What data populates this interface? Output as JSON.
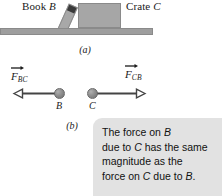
{
  "figure": {
    "panel_a": {
      "caption": "(a)",
      "book_label_text": "Book ",
      "book_label_symbol": "B",
      "crate_label_text": "Crate ",
      "crate_label_symbol": "C",
      "book_shape_name": "tilted book leaning on crate",
      "crate_shape_name": "crate block",
      "ground_name": "ground surface"
    },
    "panel_b": {
      "caption": "(b)",
      "vector_left": {
        "symbol": "F",
        "subscript": "BC",
        "direction": "left",
        "point_label": "B"
      },
      "vector_right": {
        "symbol": "F",
        "subscript": "CB",
        "direction": "right",
        "point_label": "C"
      }
    },
    "callout": {
      "lines": [
        {
          "pre": "The force on ",
          "em": "B",
          "post": ""
        },
        {
          "pre": "due to ",
          "em": "C",
          "post": " has the same"
        },
        {
          "pre": "magnitude as the",
          "em": "",
          "post": ""
        },
        {
          "pre": "force on ",
          "em": "C",
          "post": " due to "
        },
        {
          "pre": "",
          "em": "B",
          "post": "."
        }
      ],
      "line_1": "The force on B",
      "line_2": "due to C has the same",
      "line_3": "magnitude as the",
      "line_4": "force on C due to B."
    },
    "colors": {
      "crate_fill": "#a6a6a6",
      "book_fill": "#a8a8a8",
      "book_spine": "#3a3a3a",
      "ground_fill": "#9e9e9e",
      "ball_fill": "#8f8f8f",
      "callout_bg": "#e2e2e2",
      "line_color": "#444444",
      "text_color": "#1a1a1a"
    }
  }
}
